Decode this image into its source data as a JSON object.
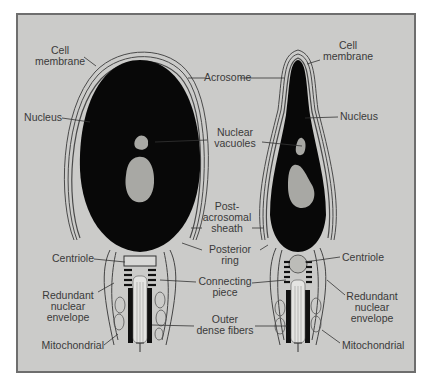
{
  "figure": {
    "background": "#cbcbc9",
    "frame_color": "#6e6e6e",
    "nucleus_color": "#080808",
    "vacuole_color": "#a8a8a4"
  },
  "left_cell": {
    "labels": {
      "cell_membrane": [
        "Cell",
        "membrane"
      ],
      "nucleus": "Nucleus",
      "centriole": "Centriole",
      "redundant_nuclear_envelope": [
        "Redundant",
        "nuclear",
        "envelope"
      ],
      "mitochondrial": "Mitochondrial"
    }
  },
  "center_labels": {
    "acrosome": "Acrosome",
    "nuclear_vacuoles": [
      "Nuclear",
      "vacuoles"
    ],
    "post_acrosomal_sheath": [
      "Post-",
      "acrosomal",
      "sheath"
    ],
    "posterior_ring": [
      "Posterior",
      "ring"
    ],
    "connecting_piece": [
      "Connecting",
      "piece"
    ],
    "outer_dense_fibers": [
      "Outer",
      "dense fibers"
    ]
  },
  "right_cell": {
    "labels": {
      "cell_membrane": [
        "Cell",
        "membrane"
      ],
      "nucleus": "Nucleus",
      "centriole": "Centriole",
      "redundant_nuclear_envelope": [
        "Redundant",
        "nuclear",
        "envelope"
      ],
      "mitochondrial": "Mitochondrial"
    }
  }
}
